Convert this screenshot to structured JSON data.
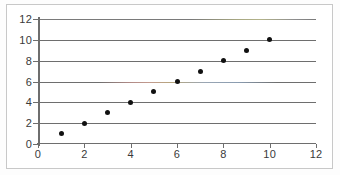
{
  "chart_data": {
    "type": "scatter",
    "title": "",
    "subtitle": "",
    "xlabel": "",
    "ylabel": "",
    "xlim": [
      0,
      12
    ],
    "ylim": [
      0,
      12
    ],
    "x_ticks": [
      0,
      2,
      4,
      6,
      8,
      10,
      12
    ],
    "y_ticks": [
      0,
      2,
      4,
      6,
      8,
      10,
      12
    ],
    "x_tick_labels": [
      "0",
      "2",
      "4",
      "6",
      "8",
      "10",
      "12"
    ],
    "y_tick_labels": [
      "0",
      "2",
      "4",
      "6",
      "8",
      "10",
      "12"
    ],
    "grid": {
      "horizontal": true,
      "vertical": false,
      "gridline_values": [
        0,
        2,
        4,
        6,
        8,
        10,
        12
      ],
      "color": "#6e6e6e"
    },
    "legend": {
      "visible": false,
      "position": "none",
      "entries": []
    },
    "annotations": [],
    "marker": {
      "shape": "circle",
      "color": "#111111",
      "size_px": 5
    },
    "series": [
      {
        "name": "",
        "x": [
          1,
          2,
          3,
          4,
          5,
          6,
          7,
          8,
          9,
          10
        ],
        "y": [
          1,
          2,
          3,
          4,
          5,
          6,
          7,
          8,
          9,
          10
        ],
        "points": [
          {
            "x": 1,
            "y": 1
          },
          {
            "x": 2,
            "y": 2
          },
          {
            "x": 3,
            "y": 3
          },
          {
            "x": 4,
            "y": 4
          },
          {
            "x": 5,
            "y": 5
          },
          {
            "x": 6,
            "y": 6
          },
          {
            "x": 7,
            "y": 7
          },
          {
            "x": 8,
            "y": 8
          },
          {
            "x": 9,
            "y": 9
          },
          {
            "x": 10,
            "y": 10
          }
        ]
      }
    ]
  },
  "figure": {
    "background_color": "#ffffff",
    "frame_color": "#c8c8c8",
    "axis_color": "#6e6e6e",
    "tick_label_color": "#3a3a3a"
  }
}
